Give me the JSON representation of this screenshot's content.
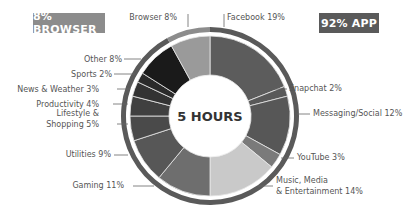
{
  "badges": {
    "browser": "8% BROWSER",
    "app": "92% APP"
  },
  "chart_data": {
    "type": "pie",
    "variant": "donut",
    "center_label": "5 HOURS",
    "start": "12 o'clock",
    "direction": "clockwise",
    "segments": [
      {
        "name": "Facebook",
        "value": 19,
        "label_lines": [
          "Facebook 19%"
        ],
        "group": "app",
        "color": "#5c5c5c"
      },
      {
        "name": "Snapchat",
        "value": 2,
        "label_lines": [
          "Snapchat 2%"
        ],
        "group": "app",
        "color": "#595959"
      },
      {
        "name": "Messaging/Social",
        "value": 12,
        "label_lines": [
          "Messaging/Social 12%"
        ],
        "group": "app",
        "color": "#575757"
      },
      {
        "name": "YouTube",
        "value": 3,
        "label_lines": [
          "YouTube 3%"
        ],
        "group": "app",
        "color": "#7a7a7a"
      },
      {
        "name": "Music, Media & Entertainment",
        "value": 14,
        "label_lines": [
          "Music, Media",
          "& Entertainment 14%"
        ],
        "group": "app",
        "color": "#c9c9c9"
      },
      {
        "name": "Gaming",
        "value": 11,
        "label_lines": [
          "Gaming 11%"
        ],
        "group": "app",
        "color": "#6e6e6e"
      },
      {
        "name": "Utilities",
        "value": 9,
        "label_lines": [
          "Utilities 9%"
        ],
        "group": "app",
        "color": "#575757"
      },
      {
        "name": "Lifestyle & Shopping",
        "value": 5,
        "label_lines": [
          "Lifestyle &",
          "Shopping 5%"
        ],
        "group": "app",
        "color": "#4a4a4a"
      },
      {
        "name": "Productivity",
        "value": 4,
        "label_lines": [
          "Productivity 4%"
        ],
        "group": "app",
        "color": "#404040"
      },
      {
        "name": "News & Weather",
        "value": 3,
        "label_lines": [
          "News & Weather 3%"
        ],
        "group": "app",
        "color": "#333333"
      },
      {
        "name": "Sports",
        "value": 2,
        "label_lines": [
          "Sports 2%"
        ],
        "group": "app",
        "color": "#2a2a2a"
      },
      {
        "name": "Other",
        "value": 8,
        "label_lines": [
          "Other 8%"
        ],
        "group": "app",
        "color": "#1a1a1a"
      },
      {
        "name": "Browser",
        "value": 8,
        "label_lines": [
          "Browser 8%"
        ],
        "group": "browser",
        "color": "#9a9a9a"
      }
    ],
    "outer_ring": [
      {
        "name": "App",
        "value": 92,
        "color": "#5a5a5a"
      },
      {
        "name": "Browser",
        "value": 8,
        "color": "#8c8c8c"
      }
    ],
    "legend": "none"
  }
}
